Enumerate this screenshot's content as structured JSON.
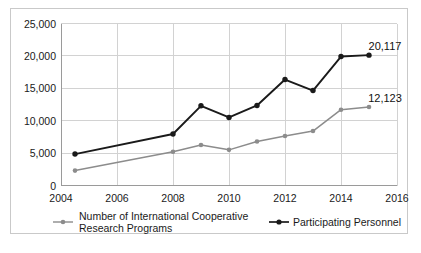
{
  "chart_data": {
    "type": "line",
    "title": "",
    "subtitle": "",
    "xlabel": "",
    "ylabel": "",
    "xlim": [
      2004,
      2016
    ],
    "ylim": [
      0,
      25000
    ],
    "grid": true,
    "legend_position": "bottom",
    "y_ticks": [
      0,
      5000,
      10000,
      15000,
      20000,
      25000
    ],
    "y_tick_labels": [
      "0",
      "5,000",
      "10,000",
      "15,000",
      "20,000",
      "25,000"
    ],
    "x_ticks": [
      2004,
      2006,
      2008,
      2010,
      2012,
      2014,
      2016
    ],
    "x_tick_labels": [
      "2004",
      "2006",
      "2008",
      "2010",
      "2012",
      "2014",
      "2016"
    ],
    "x": [
      2004.5,
      2008,
      2009,
      2010,
      2011,
      2012,
      2013,
      2014,
      2015
    ],
    "series": [
      {
        "name": "Number of International Cooperative Research Programs",
        "color": "#8c8c8c",
        "values": [
          2300,
          5200,
          6250,
          5500,
          6800,
          7650,
          8400,
          11700,
          12123
        ],
        "end_label": "12,123"
      },
      {
        "name": "Participating Personnel",
        "color": "#1a1a1a",
        "values": [
          4850,
          7950,
          12300,
          10500,
          12350,
          16350,
          14650,
          19900,
          20117
        ],
        "end_label": "20,117"
      }
    ],
    "annotations": [
      {
        "text": "20,117",
        "series": "Participating Personnel",
        "x": 2015
      },
      {
        "text": "12,123",
        "series": "Number of International Cooperative Research Programs",
        "x": 2015
      }
    ]
  },
  "legend": {
    "entries": [
      {
        "label_line1": "Number of International Cooperative",
        "label_line2": "Research Programs",
        "marker": "line-marker-gray",
        "color": "#8c8c8c"
      },
      {
        "label_line1": "Participating Personnel",
        "label_line2": "",
        "marker": "line-marker-black",
        "color": "#1a1a1a"
      }
    ]
  }
}
